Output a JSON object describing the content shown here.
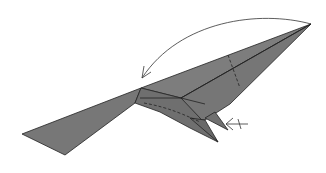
{
  "diagram": {
    "title": "Origami fold step",
    "paper_color": "#7a7a7a",
    "line_color": "#222222",
    "arrows": [
      {
        "type": "fold-over-arc",
        "meaning": "fold tip to the left"
      },
      {
        "type": "push-arrow",
        "meaning": "inside-reverse / push in",
        "marker": "x"
      }
    ],
    "fold_lines": [
      "valley-dashed-upper",
      "valley-dashed-body"
    ]
  }
}
